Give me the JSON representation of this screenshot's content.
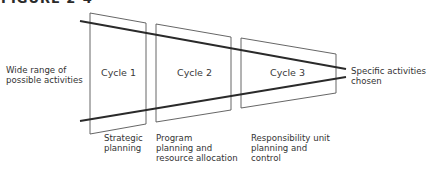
{
  "figure": {
    "heading": "FIGURE 2-4"
  },
  "diagram": {
    "left_label": "Wide range of\npossible activities",
    "right_label": "Specific activities\nchosen",
    "cycles": [
      {
        "name": "Cycle 1",
        "caption": "Strategic\nplanning"
      },
      {
        "name": "Cycle 2",
        "caption": "Program\nplanning and\nresource allocation"
      },
      {
        "name": "Cycle 3",
        "caption": "Responsibility unit\nplanning and\ncontrol"
      }
    ],
    "colors": {
      "line": "#2a2a2a",
      "box": "#555555"
    }
  }
}
